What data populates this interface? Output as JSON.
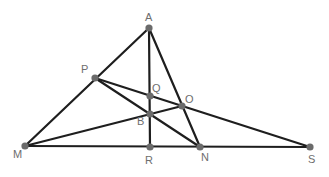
{
  "diagram": {
    "type": "geometry",
    "points": [
      {
        "name": "A",
        "x": 149,
        "y": 28,
        "lx": 145,
        "ly": 21
      },
      {
        "name": "P",
        "x": 95,
        "y": 78,
        "lx": 81,
        "ly": 73
      },
      {
        "name": "Q",
        "x": 150,
        "y": 96,
        "lx": 152,
        "ly": 92
      },
      {
        "name": "O",
        "x": 182,
        "y": 106,
        "lx": 185,
        "ly": 103
      },
      {
        "name": "B",
        "x": 150,
        "y": 114,
        "lx": 137,
        "ly": 125
      },
      {
        "name": "M",
        "x": 25,
        "y": 146,
        "lx": 13,
        "ly": 158
      },
      {
        "name": "R",
        "x": 150,
        "y": 147,
        "lx": 145,
        "ly": 164
      },
      {
        "name": "N",
        "x": 200,
        "y": 147,
        "lx": 201,
        "ly": 161
      },
      {
        "name": "S",
        "x": 310,
        "y": 147,
        "lx": 308,
        "ly": 163
      }
    ],
    "segments": [
      [
        "A",
        "M"
      ],
      [
        "A",
        "R"
      ],
      [
        "A",
        "N"
      ],
      [
        "M",
        "S"
      ],
      [
        "P",
        "N"
      ],
      [
        "P",
        "S"
      ],
      [
        "M",
        "O"
      ]
    ],
    "colors": {
      "line": "#1e1e1e",
      "point": "#6b6b6b",
      "label": "#6e6e6e"
    }
  }
}
